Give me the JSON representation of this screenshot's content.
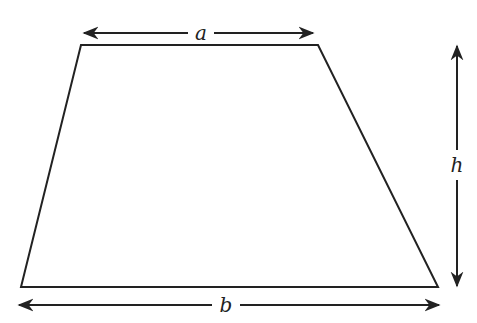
{
  "diagram": {
    "shape": "trapezoid",
    "labels": {
      "top_base": "a",
      "bottom_base": "b",
      "height": "h"
    },
    "stroke_color": "#222222",
    "background": "#ffffff"
  }
}
